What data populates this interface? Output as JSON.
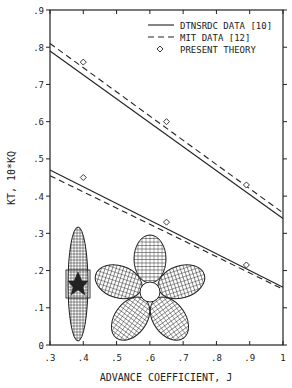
{
  "chart_data": {
    "type": "line",
    "title": "",
    "xlabel": "ADVANCE COEFFICIENT, J",
    "ylabel": "KT, 10*KQ",
    "xlim": [
      0.3,
      1.0
    ],
    "ylim": [
      0,
      0.9
    ],
    "x_ticks": [
      ".3",
      ".4",
      ".5",
      ".6",
      ".7",
      ".8",
      ".9",
      "1"
    ],
    "x_tick_values": [
      0.3,
      0.4,
      0.5,
      0.6,
      0.7,
      0.8,
      0.9,
      1.0
    ],
    "y_ticks": [
      "0",
      ".1",
      ".2",
      ".3",
      ".4",
      ".5",
      ".6",
      ".7",
      ".8",
      ".9"
    ],
    "y_tick_values": [
      0,
      0.1,
      0.2,
      0.3,
      0.4,
      0.5,
      0.6,
      0.7,
      0.8,
      0.9
    ],
    "grid": false,
    "legend_position": "upper right",
    "legend": [
      {
        "label": "DTNSRDC DATA [10]",
        "style": "solid"
      },
      {
        "label": "MIT DATA [12]",
        "style": "dashed"
      },
      {
        "label": "PRESENT THEORY",
        "style": "diamond-marker"
      }
    ],
    "series": [
      {
        "name": "DTNSRDC DATA [10] - KT",
        "style": "solid",
        "x": [
          0.3,
          1.0
        ],
        "y": [
          0.79,
          0.34
        ]
      },
      {
        "name": "MIT DATA [12] - KT",
        "style": "dashed",
        "x": [
          0.3,
          1.0
        ],
        "y": [
          0.81,
          0.355
        ]
      },
      {
        "name": "DTNSRDC DATA [10] - 10KQ",
        "style": "solid",
        "x": [
          0.3,
          1.0
        ],
        "y": [
          0.47,
          0.155
        ]
      },
      {
        "name": "MIT DATA [12] - 10KQ",
        "style": "dashed",
        "x": [
          0.3,
          1.0
        ],
        "y": [
          0.455,
          0.15
        ]
      },
      {
        "name": "PRESENT THEORY - KT",
        "style": "diamond-marker",
        "x": [
          0.4,
          0.65,
          0.89
        ],
        "y": [
          0.76,
          0.6,
          0.43
        ]
      },
      {
        "name": "PRESENT THEORY - 10KQ",
        "style": "diamond-marker",
        "x": [
          0.4,
          0.65,
          0.89
        ],
        "y": [
          0.45,
          0.33,
          0.215
        ]
      }
    ],
    "annotations": [
      {
        "type": "image",
        "description": "propeller side view wireframe",
        "position": "lower left"
      },
      {
        "type": "image",
        "description": "five-blade propeller front view wireframe",
        "position": "lower center"
      }
    ]
  },
  "colors": {
    "ink": "#222222",
    "background": "#ffffff"
  }
}
